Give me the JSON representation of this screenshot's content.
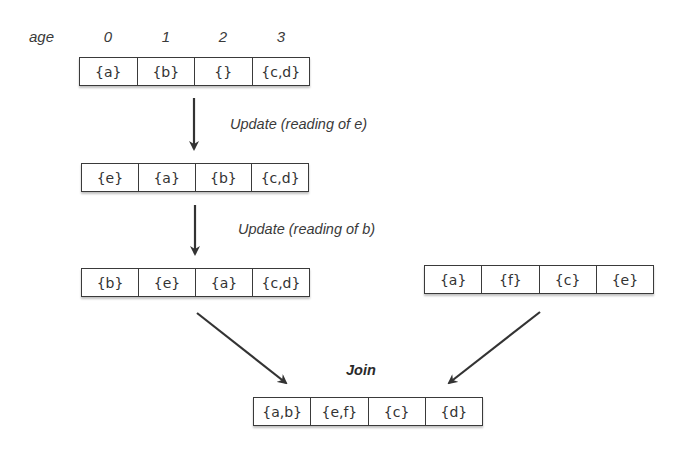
{
  "age_axis": {
    "label": "age",
    "indices": [
      "0",
      "1",
      "2",
      "3"
    ]
  },
  "rows": {
    "initial": [
      "{a}",
      "{b}",
      "{}",
      "{c,d}"
    ],
    "after_update_e": [
      "{e}",
      "{a}",
      "{b}",
      "{c,d}"
    ],
    "after_update_b": [
      "{b}",
      "{e}",
      "{a}",
      "{c,d}"
    ],
    "other": [
      "{a}",
      "{f}",
      "{c}",
      "{e}"
    ],
    "joined": [
      "{a,b}",
      "{e,f}",
      "{c}",
      "{d}"
    ]
  },
  "operations": {
    "update_e": "Update (reading of e)",
    "update_b": "Update (reading of b)",
    "join": "Join"
  },
  "colors": {
    "stroke": "#3a3a3a",
    "text": "#333333",
    "background": "#ffffff"
  }
}
